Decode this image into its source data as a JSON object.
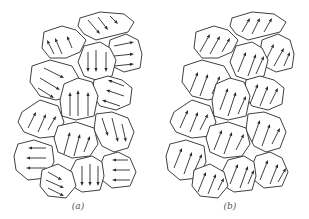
{
  "figure": {
    "panels": [
      {
        "id": "a",
        "caption": "(a)",
        "caption_x": 78,
        "description": "Randomly oriented magnetic domains",
        "grains": [
          {
            "points": "80,18 100,12 124,14 134,22 128,32 112,36 96,40 84,34 78,26",
            "arrows": [
              {
                "x1": 88,
                "y1": 20,
                "x2": 100,
                "y2": 34
              },
              {
                "x1": 98,
                "y1": 17,
                "x2": 108,
                "y2": 30
              },
              {
                "x1": 110,
                "y1": 16,
                "x2": 118,
                "y2": 24
              }
            ]
          },
          {
            "points": "44,32 62,26 76,30 86,40 80,52 66,58 50,58 42,48",
            "arrows": [
              {
                "x1": 54,
                "y1": 54,
                "x2": 47,
                "y2": 40
              },
              {
                "x1": 62,
                "y1": 54,
                "x2": 55,
                "y2": 38
              },
              {
                "x1": 72,
                "y1": 48,
                "x2": 67,
                "y2": 36
              }
            ]
          },
          {
            "points": "110,40 126,34 138,40 142,54 140,68 124,72 112,66 108,52",
            "arrows": [
              {
                "x1": 114,
                "y1": 46,
                "x2": 134,
                "y2": 42
              },
              {
                "x1": 114,
                "y1": 56,
                "x2": 134,
                "y2": 54
              },
              {
                "x1": 114,
                "y1": 66,
                "x2": 134,
                "y2": 64
              }
            ]
          },
          {
            "points": "84,46 100,42 110,48 116,60 112,76 96,80 84,76 78,62",
            "arrows": [
              {
                "x1": 88,
                "y1": 52,
                "x2": 88,
                "y2": 72
              },
              {
                "x1": 96,
                "y1": 50,
                "x2": 96,
                "y2": 72
              },
              {
                "x1": 106,
                "y1": 52,
                "x2": 106,
                "y2": 72
              }
            ]
          },
          {
            "points": "32,66 50,60 72,66 80,80 72,96 56,100 40,96 30,82",
            "arrows": [
              {
                "x1": 44,
                "y1": 68,
                "x2": 64,
                "y2": 78
              },
              {
                "x1": 40,
                "y1": 78,
                "x2": 60,
                "y2": 90
              },
              {
                "x1": 38,
                "y1": 88,
                "x2": 54,
                "y2": 98
              }
            ]
          },
          {
            "points": "94,80 108,76 122,80 132,88 130,104 116,110 100,106 92,94",
            "arrows": [
              {
                "x1": 124,
                "y1": 86,
                "x2": 108,
                "y2": 80
              },
              {
                "x1": 124,
                "y1": 96,
                "x2": 106,
                "y2": 90
              },
              {
                "x1": 120,
                "y1": 106,
                "x2": 102,
                "y2": 100
              }
            ]
          },
          {
            "points": "64,84 78,78 92,82 98,96 94,116 76,120 62,116 60,100",
            "arrows": [
              {
                "x1": 70,
                "y1": 116,
                "x2": 70,
                "y2": 92
              },
              {
                "x1": 78,
                "y1": 116,
                "x2": 78,
                "y2": 90
              },
              {
                "x1": 88,
                "y1": 116,
                "x2": 88,
                "y2": 92
              }
            ]
          },
          {
            "points": "22,112 40,100 58,106 64,122 58,136 40,138 24,132 18,122",
            "arrows": [
              {
                "x1": 28,
                "y1": 128,
                "x2": 36,
                "y2": 112
              },
              {
                "x1": 38,
                "y1": 132,
                "x2": 46,
                "y2": 114
              },
              {
                "x1": 48,
                "y1": 130,
                "x2": 56,
                "y2": 116
              }
            ]
          },
          {
            "points": "96,114 112,112 128,118 134,132 128,148 114,152 102,146 94,130",
            "arrows": [
              {
                "x1": 102,
                "y1": 118,
                "x2": 108,
                "y2": 136
              },
              {
                "x1": 112,
                "y1": 118,
                "x2": 118,
                "y2": 142
              },
              {
                "x1": 122,
                "y1": 124,
                "x2": 126,
                "y2": 142
              }
            ]
          },
          {
            "points": "58,126 76,122 94,128 98,144 90,156 72,158 58,152 54,138",
            "arrows": [
              {
                "x1": 64,
                "y1": 154,
                "x2": 70,
                "y2": 132
              },
              {
                "x1": 74,
                "y1": 156,
                "x2": 80,
                "y2": 134
              },
              {
                "x1": 84,
                "y1": 152,
                "x2": 90,
                "y2": 136
              }
            ]
          },
          {
            "points": "18,144 34,140 52,146 54,162 46,178 28,180 16,170 14,156",
            "arrows": [
              {
                "x1": 46,
                "y1": 148,
                "x2": 28,
                "y2": 148
              },
              {
                "x1": 46,
                "y1": 158,
                "x2": 26,
                "y2": 158
              },
              {
                "x1": 46,
                "y1": 168,
                "x2": 26,
                "y2": 168
              }
            ]
          },
          {
            "points": "104,156 118,152 130,158 136,172 130,186 112,188 102,180 100,166",
            "arrows": [
              {
                "x1": 128,
                "y1": 160,
                "x2": 112,
                "y2": 160
              },
              {
                "x1": 130,
                "y1": 170,
                "x2": 112,
                "y2": 170
              },
              {
                "x1": 130,
                "y1": 180,
                "x2": 112,
                "y2": 180
              }
            ]
          },
          {
            "points": "76,160 92,156 102,162 104,176 100,190 82,192 72,186 70,172",
            "arrows": [
              {
                "x1": 82,
                "y1": 166,
                "x2": 82,
                "y2": 186
              },
              {
                "x1": 90,
                "y1": 164,
                "x2": 90,
                "y2": 186
              },
              {
                "x1": 98,
                "y1": 166,
                "x2": 98,
                "y2": 186
              }
            ]
          },
          {
            "points": "42,170 58,164 72,172 76,186 66,198 48,196 40,186",
            "arrows": [
              {
                "x1": 48,
                "y1": 172,
                "x2": 62,
                "y2": 180
              },
              {
                "x1": 46,
                "y1": 180,
                "x2": 64,
                "y2": 188
              },
              {
                "x1": 48,
                "y1": 188,
                "x2": 64,
                "y2": 196
              }
            ]
          }
        ]
      },
      {
        "id": "b",
        "caption": "(b)",
        "caption_x": 230,
        "description": "Aligned magnetic domains",
        "grains": [
          {
            "points": "232,18 252,12 274,14 286,22 280,32 264,36 248,40 236,34 230,26",
            "arrows": [
              {
                "x1": 242,
                "y1": 32,
                "x2": 250,
                "y2": 18
              },
              {
                "x1": 252,
                "y1": 34,
                "x2": 260,
                "y2": 18
              },
              {
                "x1": 264,
                "y1": 32,
                "x2": 272,
                "y2": 18
              }
            ]
          },
          {
            "points": "196,32 214,26 228,30 238,40 232,52 218,58 202,58 194,48",
            "arrows": [
              {
                "x1": 200,
                "y1": 52,
                "x2": 210,
                "y2": 34
              },
              {
                "x1": 210,
                "y1": 54,
                "x2": 220,
                "y2": 36
              },
              {
                "x1": 222,
                "y1": 52,
                "x2": 230,
                "y2": 38
              }
            ]
          },
          {
            "points": "262,40 278,34 290,40 294,54 292,68 276,72 264,66 260,52",
            "arrows": [
              {
                "x1": 266,
                "y1": 60,
                "x2": 274,
                "y2": 44
              },
              {
                "x1": 274,
                "y1": 66,
                "x2": 284,
                "y2": 48
              },
              {
                "x1": 284,
                "y1": 66,
                "x2": 290,
                "y2": 52
              }
            ]
          },
          {
            "points": "236,46 252,42 262,48 268,60 264,76 248,80 236,76 230,62",
            "arrows": [
              {
                "x1": 238,
                "y1": 72,
                "x2": 246,
                "y2": 52
              },
              {
                "x1": 248,
                "y1": 76,
                "x2": 256,
                "y2": 54
              },
              {
                "x1": 256,
                "y1": 74,
                "x2": 264,
                "y2": 56
              }
            ]
          },
          {
            "points": "184,66 202,60 224,66 232,80 224,96 208,100 192,96 182,82",
            "arrows": [
              {
                "x1": 190,
                "y1": 92,
                "x2": 198,
                "y2": 72
              },
              {
                "x1": 200,
                "y1": 96,
                "x2": 208,
                "y2": 74
              },
              {
                "x1": 212,
                "y1": 94,
                "x2": 220,
                "y2": 76
              }
            ]
          },
          {
            "points": "246,80 260,76 274,80 284,88 282,104 268,110 252,106 244,94",
            "arrows": [
              {
                "x1": 250,
                "y1": 104,
                "x2": 258,
                "y2": 84
              },
              {
                "x1": 260,
                "y1": 106,
                "x2": 268,
                "y2": 86
              },
              {
                "x1": 270,
                "y1": 104,
                "x2": 278,
                "y2": 88
              }
            ]
          },
          {
            "points": "216,84 230,78 244,82 250,96 246,116 228,120 214,116 212,100",
            "arrows": [
              {
                "x1": 220,
                "y1": 110,
                "x2": 228,
                "y2": 88
              },
              {
                "x1": 228,
                "y1": 116,
                "x2": 236,
                "y2": 92
              },
              {
                "x1": 238,
                "y1": 114,
                "x2": 246,
                "y2": 96
              }
            ]
          },
          {
            "points": "174,112 192,100 210,106 216,122 210,136 192,138 176,132 170,122",
            "arrows": [
              {
                "x1": 180,
                "y1": 128,
                "x2": 188,
                "y2": 110
              },
              {
                "x1": 190,
                "y1": 132,
                "x2": 198,
                "y2": 112
              },
              {
                "x1": 200,
                "y1": 130,
                "x2": 208,
                "y2": 114
              }
            ]
          },
          {
            "points": "248,114 264,112 280,118 286,132 280,148 266,152 254,146 246,130",
            "arrows": [
              {
                "x1": 252,
                "y1": 142,
                "x2": 260,
                "y2": 120
              },
              {
                "x1": 262,
                "y1": 146,
                "x2": 270,
                "y2": 124
              },
              {
                "x1": 272,
                "y1": 144,
                "x2": 280,
                "y2": 128
              }
            ]
          },
          {
            "points": "210,126 228,122 246,128 250,144 242,156 224,158 210,152 206,138",
            "arrows": [
              {
                "x1": 214,
                "y1": 150,
                "x2": 222,
                "y2": 130
              },
              {
                "x1": 224,
                "y1": 154,
                "x2": 232,
                "y2": 132
              },
              {
                "x1": 236,
                "y1": 150,
                "x2": 244,
                "y2": 134
              }
            ]
          },
          {
            "points": "170,144 186,140 204,146 206,162 198,178 180,180 168,170 166,156",
            "arrows": [
              {
                "x1": 174,
                "y1": 168,
                "x2": 182,
                "y2": 148
              },
              {
                "x1": 184,
                "y1": 174,
                "x2": 192,
                "y2": 152
              },
              {
                "x1": 194,
                "y1": 172,
                "x2": 202,
                "y2": 154
              }
            ]
          },
          {
            "points": "256,156 270,152 282,158 288,172 282,186 264,188 254,180 252,166",
            "arrows": [
              {
                "x1": 260,
                "y1": 180,
                "x2": 268,
                "y2": 160
              },
              {
                "x1": 270,
                "y1": 184,
                "x2": 278,
                "y2": 164
              },
              {
                "x1": 278,
                "y1": 182,
                "x2": 286,
                "y2": 168
              }
            ]
          },
          {
            "points": "228,160 244,156 254,162 256,176 252,190 234,192 224,186 222,172",
            "arrows": [
              {
                "x1": 230,
                "y1": 184,
                "x2": 238,
                "y2": 164
              },
              {
                "x1": 240,
                "y1": 188,
                "x2": 248,
                "y2": 166
              },
              {
                "x1": 248,
                "y1": 184,
                "x2": 254,
                "y2": 170
              }
            ]
          },
          {
            "points": "194,170 210,164 224,172 228,186 218,198 200,196 192,186",
            "arrows": [
              {
                "x1": 198,
                "y1": 192,
                "x2": 206,
                "y2": 172
              },
              {
                "x1": 208,
                "y1": 194,
                "x2": 216,
                "y2": 174
              },
              {
                "x1": 218,
                "y1": 190,
                "x2": 224,
                "y2": 178
              }
            ]
          }
        ]
      }
    ]
  }
}
